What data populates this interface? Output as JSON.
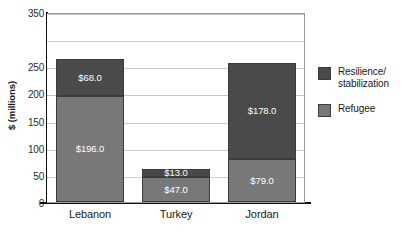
{
  "chart_data": {
    "type": "bar",
    "subtype": "stacked-bar-vertical",
    "title": "",
    "xlabel": "",
    "ylabel": "$ (millions)",
    "ylim": [
      0,
      350
    ],
    "yticks": [
      0,
      50,
      100,
      150,
      200,
      250,
      350
    ],
    "ytick_labels": [
      "0",
      "50",
      "100",
      "150",
      "200",
      "250",
      "350"
    ],
    "gridlines": [
      50,
      100,
      150,
      200,
      250,
      300,
      350
    ],
    "grid": true,
    "legend_position": "right",
    "categories": [
      "Lebanon",
      "Turkey",
      "Jordan"
    ],
    "series": [
      {
        "name": "Refugee",
        "color": "#787878",
        "values": [
          196.0,
          47.0,
          79.0
        ],
        "labels": [
          "$196.0",
          "$47.0",
          "$79.0"
        ]
      },
      {
        "name": "Resilience/stabilization",
        "color": "#4a4a4a",
        "values": [
          68.0,
          13.0,
          178.0
        ],
        "labels": [
          "$68.0",
          "$13.0",
          "$178.0"
        ]
      }
    ],
    "totals": [
      264.0,
      60.0,
      257.0
    ]
  },
  "axis": {
    "y_title": "$ (millions)"
  },
  "legend": {
    "items": [
      {
        "label": "Resilience/ stabilization",
        "color": "#4a4a4a"
      },
      {
        "label": "Refugee",
        "color": "#787878"
      }
    ]
  }
}
